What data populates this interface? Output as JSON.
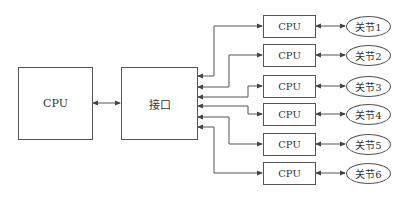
{
  "diagram": {
    "main_cpu": {
      "label": "CPU"
    },
    "interface": {
      "label": "接口"
    },
    "nodes": [
      {
        "cpu_label": "CPU",
        "joint_label": "关节1"
      },
      {
        "cpu_label": "CPU",
        "joint_label": "关节2"
      },
      {
        "cpu_label": "CPU",
        "joint_label": "关节3"
      },
      {
        "cpu_label": "CPU",
        "joint_label": "关节4"
      },
      {
        "cpu_label": "CPU",
        "joint_label": "关节5"
      },
      {
        "cpu_label": "CPU",
        "joint_label": "关节6"
      }
    ],
    "colors": {
      "line": "#555555",
      "background": "#ffffff",
      "text": "#333333"
    }
  }
}
